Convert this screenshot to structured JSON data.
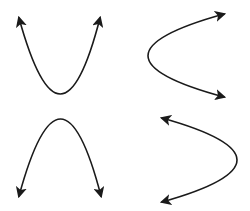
{
  "diagram": {
    "title": "",
    "stroke_color": "#1a1a1a",
    "background_color": "#ffffff",
    "parabolas": [
      {
        "id": "opens-up",
        "orientation": "up",
        "arrows": "both-ends"
      },
      {
        "id": "opens-right",
        "orientation": "right",
        "arrows": "both-ends"
      },
      {
        "id": "opens-down",
        "orientation": "down",
        "arrows": "both-ends"
      },
      {
        "id": "opens-left",
        "orientation": "left",
        "arrows": "both-ends"
      }
    ]
  }
}
